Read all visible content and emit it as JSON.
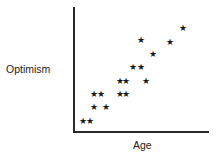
{
  "chart_data": {
    "type": "scatter",
    "title": "",
    "xlabel": "Age",
    "ylabel": "Optimism",
    "marker": "star",
    "grid": false,
    "legend": null,
    "x_ticks": [],
    "y_ticks": [],
    "xlim": [
      0,
      10
    ],
    "ylim": [
      0,
      10
    ],
    "points": [
      {
        "x": 0.7,
        "y": 0.8
      },
      {
        "x": 1.2,
        "y": 0.8
      },
      {
        "x": 1.5,
        "y": 1.9
      },
      {
        "x": 2.4,
        "y": 1.9
      },
      {
        "x": 1.5,
        "y": 3.0
      },
      {
        "x": 2.0,
        "y": 3.0
      },
      {
        "x": 3.4,
        "y": 3.0
      },
      {
        "x": 3.9,
        "y": 3.0
      },
      {
        "x": 3.4,
        "y": 4.0
      },
      {
        "x": 3.9,
        "y": 4.0
      },
      {
        "x": 5.4,
        "y": 4.0
      },
      {
        "x": 4.4,
        "y": 5.2
      },
      {
        "x": 5.0,
        "y": 5.2
      },
      {
        "x": 5.9,
        "y": 6.2
      },
      {
        "x": 5.0,
        "y": 7.3
      },
      {
        "x": 7.2,
        "y": 7.2
      },
      {
        "x": 8.1,
        "y": 8.3
      }
    ]
  },
  "labels": {
    "x": "Age",
    "y": "Optimism"
  },
  "marker_glyph": "★"
}
